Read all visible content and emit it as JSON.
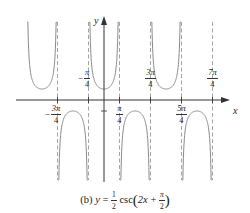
{
  "chart_data": {
    "type": "line",
    "caption_prefix": "(b)",
    "function": "y = (1/2) csc(2x + π/2)",
    "xlabel": "x",
    "ylabel": "y",
    "x_ticks": [
      {
        "value": "-3π/4",
        "num": "3π",
        "den": "4",
        "negative": true
      },
      {
        "value": "-π/4",
        "num": "π",
        "den": "4",
        "negative": true
      },
      {
        "value": "π/4",
        "num": "π",
        "den": "4",
        "negative": false
      },
      {
        "value": "3π/4",
        "num": "3π",
        "den": "4",
        "negative": false
      },
      {
        "value": "5π/4",
        "num": "5π",
        "den": "4",
        "negative": false
      },
      {
        "value": "7π/4",
        "num": "7π",
        "den": "4",
        "negative": false
      }
    ],
    "asymptotes": [
      "-3π/4",
      "-π/4",
      "π/4",
      "3π/4",
      "5π/4",
      "7π/4"
    ],
    "local_minima_y": 0.5,
    "local_maxima_y": -0.5,
    "branches": [
      {
        "interval": [
          "-5π/4",
          "-3π/4"
        ],
        "direction": "up",
        "extremum": [
          -1.0,
          0.5
        ]
      },
      {
        "interval": [
          "-3π/4",
          "-π/4"
        ],
        "direction": "down",
        "extremum": [
          -0.5,
          -0.5
        ]
      },
      {
        "interval": [
          "-π/4",
          "π/4"
        ],
        "direction": "up",
        "extremum": [
          0,
          0.5
        ]
      },
      {
        "interval": [
          "π/4",
          "3π/4"
        ],
        "direction": "down",
        "extremum": [
          0.5,
          -0.5
        ]
      },
      {
        "interval": [
          "3π/4",
          "5π/4"
        ],
        "direction": "up",
        "extremum": [
          1.0,
          0.5
        ]
      },
      {
        "interval": [
          "5π/4",
          "7π/4"
        ],
        "direction": "down",
        "extremum": [
          1.5,
          -0.5
        ]
      }
    ],
    "grid": false,
    "legend": "none"
  },
  "colors": {
    "curve": "#8a8a8a",
    "axis": "#333333",
    "asymptote": "#9a9a9a"
  },
  "caption": {
    "prefix": "(b)",
    "y": "y",
    "equals": "=",
    "half_num": "1",
    "half_den": "2",
    "func": "csc",
    "arg_left": "2x",
    "plus": "+",
    "pi_num": "π",
    "pi_den": "2"
  }
}
